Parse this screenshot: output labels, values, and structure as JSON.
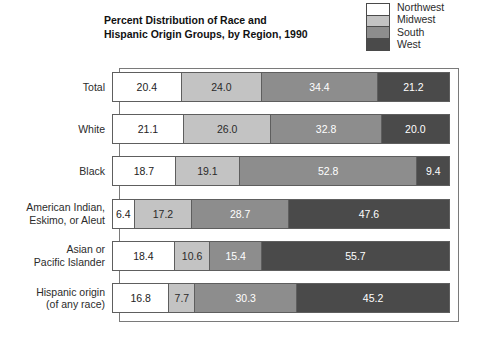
{
  "title": {
    "line1": "Percent Distribution of Race and",
    "line2": "Hispanic Origin Groups, by Region, 1990"
  },
  "legend": {
    "items": [
      {
        "label": "Northwest",
        "color": "#ffffff"
      },
      {
        "label": "Midwest",
        "color": "#c3c3c3"
      },
      {
        "label": "South",
        "color": "#8d8d8d"
      },
      {
        "label": "West",
        "color": "#4a4a4a"
      }
    ]
  },
  "chart_data": {
    "type": "bar",
    "orientation": "horizontal",
    "stacked": true,
    "normalized_to_percent": true,
    "title": "Percent Distribution of Race and Hispanic Origin Groups, by Region, 1990",
    "xlabel": "",
    "ylabel": "",
    "xlim": [
      0,
      100
    ],
    "grid": false,
    "legend_position": "top-right",
    "categories": [
      "Total",
      "White",
      "Black",
      "American Indian, Eskimo, or Aleut",
      "Asian or Pacific Islander",
      "Hispanic origin (of any race)"
    ],
    "series": [
      {
        "name": "Northwest",
        "color": "#ffffff",
        "values": [
          20.4,
          21.1,
          18.7,
          6.4,
          18.4,
          16.8
        ]
      },
      {
        "name": "Midwest",
        "color": "#c3c3c3",
        "values": [
          24.0,
          26.0,
          19.1,
          17.2,
          10.6,
          7.7
        ]
      },
      {
        "name": "South",
        "color": "#8d8d8d",
        "values": [
          34.4,
          32.8,
          52.8,
          28.7,
          15.4,
          30.3
        ]
      },
      {
        "name": "West",
        "color": "#4a4a4a",
        "values": [
          21.2,
          20.0,
          9.4,
          47.6,
          55.7,
          45.2
        ]
      }
    ]
  },
  "rows": [
    {
      "label_lines": [
        "Total"
      ],
      "segments": [
        {
          "region": "Northwest",
          "value": "20.4",
          "pct": 20.4
        },
        {
          "region": "Midwest",
          "value": "24.0",
          "pct": 24.0
        },
        {
          "region": "South",
          "value": "34.4",
          "pct": 34.4
        },
        {
          "region": "West",
          "value": "21.2",
          "pct": 21.2
        }
      ]
    },
    {
      "label_lines": [
        "White"
      ],
      "segments": [
        {
          "region": "Northwest",
          "value": "21.1",
          "pct": 21.1
        },
        {
          "region": "Midwest",
          "value": "26.0",
          "pct": 26.0
        },
        {
          "region": "South",
          "value": "32.8",
          "pct": 32.8
        },
        {
          "region": "West",
          "value": "20.0",
          "pct": 20.0
        }
      ]
    },
    {
      "label_lines": [
        "Black"
      ],
      "segments": [
        {
          "region": "Northwest",
          "value": "18.7",
          "pct": 18.7
        },
        {
          "region": "Midwest",
          "value": "19.1",
          "pct": 19.1
        },
        {
          "region": "South",
          "value": "52.8",
          "pct": 52.8
        },
        {
          "region": "West",
          "value": "9.4",
          "pct": 9.4
        }
      ]
    },
    {
      "label_lines": [
        "American Indian,",
        "Eskimo, or Aleut"
      ],
      "segments": [
        {
          "region": "Northwest",
          "value": "6.4",
          "pct": 6.4
        },
        {
          "region": "Midwest",
          "value": "17.2",
          "pct": 17.2
        },
        {
          "region": "South",
          "value": "28.7",
          "pct": 28.7
        },
        {
          "region": "West",
          "value": "47.6",
          "pct": 47.6
        }
      ]
    },
    {
      "label_lines": [
        "Asian or",
        "Pacific Islander"
      ],
      "segments": [
        {
          "region": "Northwest",
          "value": "18.4",
          "pct": 18.4
        },
        {
          "region": "Midwest",
          "value": "10.6",
          "pct": 10.6
        },
        {
          "region": "South",
          "value": "15.4",
          "pct": 15.4
        },
        {
          "region": "West",
          "value": "55.7",
          "pct": 55.7
        }
      ]
    },
    {
      "label_lines": [
        "Hispanic origin",
        "(of any race)"
      ],
      "segments": [
        {
          "region": "Northwest",
          "value": "16.8",
          "pct": 16.8
        },
        {
          "region": "Midwest",
          "value": "7.7",
          "pct": 7.7
        },
        {
          "region": "South",
          "value": "30.3",
          "pct": 30.3
        },
        {
          "region": "West",
          "value": "45.2",
          "pct": 45.2
        }
      ]
    }
  ]
}
